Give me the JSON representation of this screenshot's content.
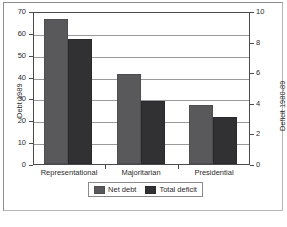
{
  "chart_data": {
    "type": "bar",
    "title": "",
    "subtitle": "",
    "xlabel": "",
    "categories": [
      "Representational",
      "Majoritarian",
      "Presidential"
    ],
    "series": [
      {
        "name": "Net debt",
        "axis": "left",
        "color": "#59595b",
        "values": [
          66.3,
          41.2,
          27.1
        ]
      },
      {
        "name": "Total deficit",
        "axis": "right",
        "color": "#313133",
        "values": [
          8.2,
          4.1,
          3.1
        ]
      }
    ],
    "axes": {
      "left": {
        "label": "Debt 1989",
        "ticks": [
          0,
          10,
          20,
          30,
          40,
          50,
          60,
          70
        ],
        "tick_labels": [
          "0",
          "10",
          "20",
          "30",
          "40",
          "50",
          "60",
          "70"
        ],
        "min": 0,
        "max": 70
      },
      "right": {
        "label": "Deficit 1980-89",
        "ticks": [
          0,
          2,
          4,
          6,
          8,
          10
        ],
        "tick_labels": [
          "0",
          "2",
          "4",
          "6",
          "8",
          "10"
        ],
        "min": 0,
        "max": 10
      }
    },
    "grid": true,
    "legend": {
      "position": "bottom",
      "entries": [
        "Net debt",
        "Total deficit"
      ]
    }
  },
  "render": {
    "total_deficit_left_equivalent": [
      57.3,
      28.6,
      21.6
    ]
  }
}
